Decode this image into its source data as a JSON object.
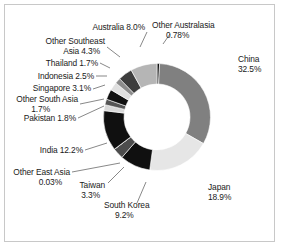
{
  "chart_data": {
    "type": "pie",
    "variant": "donut",
    "title": "",
    "subtitle": "",
    "xlabel": "",
    "ylabel": "",
    "legend_position": "none",
    "grid": false,
    "units": "percent",
    "start_angle_deg": 0,
    "direction": "clockwise",
    "total": 100,
    "categories": [
      "Other Australasia",
      "China",
      "Japan",
      "South Korea",
      "Taiwan",
      "Other East Asia",
      "India",
      "Pakistan",
      "Other South Asia",
      "Singapore",
      "Indonesia",
      "Thailand",
      "Other Southeast Asia",
      "Australia"
    ],
    "values": [
      0.78,
      32.5,
      18.9,
      9.2,
      3.3,
      0.03,
      12.2,
      1.8,
      1.7,
      3.1,
      2.5,
      1.7,
      4.3,
      8.0
    ],
    "value_labels": [
      "0.78%",
      "32.5%",
      "18.9%",
      "9.2%",
      "3.3%",
      "0.03%",
      "12.2%",
      "1.8%",
      "1.7%",
      "3.1%",
      "2.5%",
      "1.7%",
      "4.3%",
      "8.0%"
    ],
    "colors": [
      "#111111",
      "#808080",
      "#e6e6e6",
      "#101010",
      "#4d4d4d",
      "#dcdcdc",
      "#101010",
      "#d9d9d9",
      "#555555",
      "#101010",
      "#e0e0e0",
      "#8c8c8c",
      "#3d3d3d",
      "#b5b5b5"
    ],
    "slices": [
      {
        "name": "Other Australasia",
        "value": 0.78,
        "value_label": "0.78%",
        "color": "#111111"
      },
      {
        "name": "China",
        "value": 32.5,
        "value_label": "32.5%",
        "color": "#808080"
      },
      {
        "name": "Japan",
        "value": 18.9,
        "value_label": "18.9%",
        "color": "#e6e6e6"
      },
      {
        "name": "South Korea",
        "value": 9.2,
        "value_label": "9.2%",
        "color": "#101010"
      },
      {
        "name": "Taiwan",
        "value": 3.3,
        "value_label": "3.3%",
        "color": "#4d4d4d"
      },
      {
        "name": "Other East Asia",
        "value": 0.03,
        "value_label": "0.03%",
        "color": "#dcdcdc"
      },
      {
        "name": "India",
        "value": 12.2,
        "value_label": "12.2%",
        "color": "#101010"
      },
      {
        "name": "Pakistan",
        "value": 1.8,
        "value_label": "1.8%",
        "color": "#d9d9d9"
      },
      {
        "name": "Other South Asia",
        "value": 1.7,
        "value_label": "1.7%",
        "color": "#555555"
      },
      {
        "name": "Singapore",
        "value": 3.1,
        "value_label": "3.1%",
        "color": "#101010"
      },
      {
        "name": "Indonesia",
        "value": 2.5,
        "value_label": "2.5%",
        "color": "#e0e0e0"
      },
      {
        "name": "Thailand",
        "value": 1.7,
        "value_label": "1.7%",
        "color": "#8c8c8c"
      },
      {
        "name": "Other Southeast Asia",
        "value": 4.3,
        "value_label": "4.3%",
        "color": "#3d3d3d"
      },
      {
        "name": "Australia",
        "value": 8.0,
        "value_label": "8.0%",
        "color": "#b5b5b5"
      }
    ]
  },
  "labels": {
    "other_australasia_name": "Other Australasia",
    "other_australasia_value": "0.78%",
    "china_name": "China",
    "china_value": "32.5%",
    "japan_name": "Japan",
    "japan_value": "18.9%",
    "south_korea_name": "South Korea",
    "south_korea_value": "9.2%",
    "taiwan_name": "Taiwan",
    "taiwan_value": "3.3%",
    "other_east_asia_name": "Other East Asia",
    "other_east_asia_value": "0.03%",
    "india_line": "India    12.2%",
    "pakistan_line": "Pakistan   1.8%",
    "other_south_asia_name": "Other South Asia",
    "other_south_asia_value": "1.7%",
    "singapore_line": "Singapore    3.1%",
    "indonesia_line": "Indonesia   2.5%",
    "thailand_line": "Thailand   1.7%",
    "other_southeast_asia_line1": "Other Southeast",
    "other_southeast_asia_line2": "Asia   4.3%",
    "australia_line": "Australia    8.0%"
  },
  "style": {
    "background": "#ffffff",
    "frame_color": "#c8c8c8",
    "text_color": "#1a1a1a",
    "leader_color": "#555555"
  }
}
